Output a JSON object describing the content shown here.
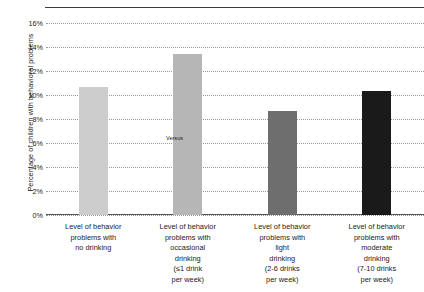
{
  "chart_data": {
    "type": "bar",
    "title": "",
    "subtitle": "",
    "xlabel": "",
    "ylabel": "Percentage of children with behavioral problems",
    "ylim": [
      0,
      16
    ],
    "ytick_values": [
      16,
      14,
      12,
      10,
      8,
      6,
      4,
      2,
      0
    ],
    "ytick_labels": [
      "16%",
      "14%",
      "12%",
      "10%",
      "8%",
      "6%",
      "4%",
      "2%",
      "0%"
    ],
    "grid": true,
    "legend": null,
    "categories": [
      "Level of behavior problems with no drinking",
      "Level of behavior problems with occasional drinking (≤1 drink per week)",
      "Level of behavior problems with light drinking (2-6 drinks per week)",
      "Level of behavior problems with moderate drinking (7-10 drinks per week)"
    ],
    "category_lines": [
      [
        "Level of behavior",
        "problems with",
        "no drinking"
      ],
      [
        "Level of behavior",
        "problems with",
        "occasional",
        "drinking",
        "(≤1 drink",
        "per week)"
      ],
      [
        "Level of behavior",
        "problems with",
        "light",
        "drinking",
        "(2-6 drinks",
        "per week)"
      ],
      [
        "Level of behavior",
        "problems with",
        "moderate",
        "drinking",
        "(7-10 drinks",
        "per week)"
      ]
    ],
    "values": [
      10.7,
      13.4,
      8.7,
      10.3
    ],
    "bar_colors": [
      "#cdcdcd",
      "#b6b6b6",
      "#6e6e6e",
      "#1a1a1a"
    ],
    "annotations": [
      {
        "text": "Versus",
        "x_pct": 34.0,
        "y_value": 6.4
      }
    ]
  },
  "axis": {
    "y_title": "Percentage of children with behavioral problems"
  }
}
